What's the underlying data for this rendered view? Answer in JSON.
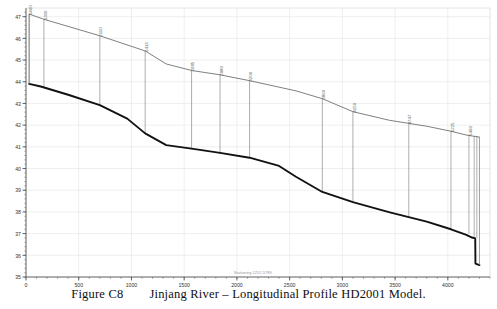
{
  "figure": {
    "caption_number": "Figure C8",
    "caption_text": "Jinjang River – Longitudinal Profile HD2001 Model.",
    "axis_note": "Stationing 1252-5789"
  },
  "colors": {
    "bed_line": "#111111",
    "water_line": "#555555",
    "section_line": "#777777",
    "grid": "#e8e8e8",
    "axis": "#555555",
    "label": "#666666",
    "background": "#ffffff"
  },
  "chart_data": {
    "type": "line",
    "title": "",
    "xlabel": "",
    "ylabel": "",
    "xlim": [
      0,
      4400
    ],
    "ylim": [
      35,
      47.4
    ],
    "grid": true,
    "legend_position": "none",
    "x_ticks": [
      0,
      500,
      1000,
      1500,
      2000,
      2500,
      3000,
      3500,
      4000
    ],
    "y_ticks": [
      35,
      36,
      37,
      38,
      39,
      40,
      41,
      42,
      43,
      44,
      45,
      46,
      47
    ],
    "series": [
      {
        "name": "Water Surface",
        "style": "thin",
        "x": [
          30,
          170,
          700,
          1130,
          1330,
          1570,
          1840,
          2120,
          2560,
          2810,
          3100,
          3450,
          3800,
          4030,
          4170,
          4230,
          4260,
          4300
        ],
        "values": [
          47.12,
          46.88,
          46.12,
          45.42,
          44.82,
          44.52,
          44.32,
          44.05,
          43.58,
          43.22,
          42.62,
          42.22,
          41.95,
          41.72,
          41.55,
          41.5,
          41.48,
          41.45
        ]
      },
      {
        "name": "River Bed",
        "style": "thick",
        "x": [
          30,
          140,
          400,
          700,
          960,
          1130,
          1330,
          1570,
          1840,
          2120,
          2400,
          2560,
          2810,
          3100,
          3450,
          3800,
          4030,
          4170,
          4230,
          4260,
          4262,
          4300
        ],
        "values": [
          43.9,
          43.78,
          43.4,
          42.92,
          42.3,
          41.62,
          41.08,
          40.92,
          40.72,
          40.5,
          40.12,
          39.62,
          38.92,
          38.45,
          37.98,
          37.55,
          37.2,
          36.95,
          36.82,
          36.78,
          35.62,
          35.55
        ]
      }
    ],
    "cross_sections": [
      {
        "label": "5400",
        "x": 30,
        "top": 47.12,
        "bottom": 43.9
      },
      {
        "label": "5300",
        "x": 170,
        "top": 46.88,
        "bottom": 43.72
      },
      {
        "label": "2110",
        "x": 700,
        "top": 46.12,
        "bottom": 42.92
      },
      {
        "label": "2413",
        "x": 1130,
        "top": 45.42,
        "bottom": 41.62
      },
      {
        "label": "2685",
        "x": 1570,
        "top": 44.52,
        "bottom": 40.92
      },
      {
        "label": "2980",
        "x": 1840,
        "top": 44.32,
        "bottom": 40.72
      },
      {
        "label": "3200",
        "x": 2120,
        "top": 44.05,
        "bottom": 40.5
      },
      {
        "label": "3860",
        "x": 2810,
        "top": 43.22,
        "bottom": 38.92
      },
      {
        "label": "4150",
        "x": 3100,
        "top": 42.62,
        "bottom": 38.45
      },
      {
        "label": "4747",
        "x": 3630,
        "top": 42.08,
        "bottom": 37.75
      },
      {
        "label": "5225",
        "x": 4030,
        "top": 41.72,
        "bottom": 37.2
      },
      {
        "label": "5466",
        "x": 4200,
        "top": 41.55,
        "bottom": 37.0
      },
      {
        "label": "",
        "x": 4250,
        "top": 41.5,
        "bottom": 36.85
      },
      {
        "label": "",
        "x": 4275,
        "top": 41.48,
        "bottom": 36.8
      }
    ]
  }
}
